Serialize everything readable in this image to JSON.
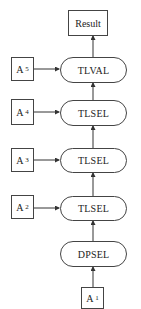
{
  "result": {
    "label": "Result"
  },
  "nodes": [
    {
      "id": "tlval",
      "label": "TLVAL"
    },
    {
      "id": "tlsel4",
      "label": "TLSEL"
    },
    {
      "id": "tlsel3",
      "label": "TLSEL"
    },
    {
      "id": "tlsel2",
      "label": "TLSEL"
    },
    {
      "id": "dpsel",
      "label": "DPSEL"
    }
  ],
  "inputs": [
    {
      "id": "a5",
      "label": "A",
      "sub": "5"
    },
    {
      "id": "a4",
      "label": "A",
      "sub": "4"
    },
    {
      "id": "a3",
      "label": "A",
      "sub": "3"
    },
    {
      "id": "a2",
      "label": "A",
      "sub": "2"
    },
    {
      "id": "a1",
      "label": "A",
      "sub": "1"
    }
  ]
}
